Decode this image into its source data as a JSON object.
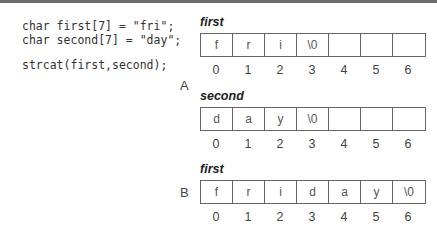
{
  "code": {
    "lines": [
      "char first[7] = \"fri\";",
      "char second[7] = \"day\";",
      "",
      "strcat(first,second);"
    ]
  },
  "section_labels": {
    "a": "A",
    "b": "B"
  },
  "arrays": [
    {
      "name": "first",
      "cells": [
        "f",
        "r",
        "i",
        "\\0",
        "",
        "",
        ""
      ],
      "indices": [
        "0",
        "1",
        "2",
        "3",
        "4",
        "5",
        "6"
      ]
    },
    {
      "name": "second",
      "cells": [
        "d",
        "a",
        "y",
        "\\0",
        "",
        "",
        ""
      ],
      "indices": [
        "0",
        "1",
        "2",
        "3",
        "4",
        "5",
        "6"
      ]
    },
    {
      "name": "first",
      "cells": [
        "f",
        "r",
        "i",
        "d",
        "a",
        "y",
        "\\0"
      ],
      "indices": [
        "0",
        "1",
        "2",
        "3",
        "4",
        "5",
        "6"
      ]
    }
  ]
}
